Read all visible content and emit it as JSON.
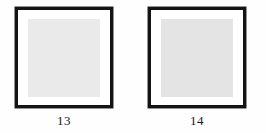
{
  "document": {
    "type": "figure-plate",
    "background_color": "#fefefe"
  },
  "panels": [
    {
      "caption": "13",
      "frame_color": "#141414",
      "matte_color": "#ffffff",
      "specimen_color": "#eaeaea"
    },
    {
      "caption": "14",
      "frame_color": "#141414",
      "matte_color": "#ffffff",
      "specimen_color": "#e4e4e4"
    }
  ]
}
